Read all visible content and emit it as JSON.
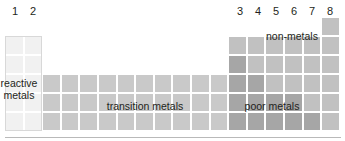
{
  "figure": {
    "kind": "periodic-table-schematic",
    "background": "#ffffff",
    "baseline_color": "#b9b9b9"
  },
  "column_labels": [
    {
      "text": "1",
      "x": 8
    },
    {
      "text": "2",
      "x": 26
    },
    {
      "text": "3",
      "x": 233
    },
    {
      "text": "4",
      "x": 251
    },
    {
      "text": "5",
      "x": 269
    },
    {
      "text": "6",
      "x": 287
    },
    {
      "text": "7",
      "x": 305
    },
    {
      "text": "8",
      "x": 323
    }
  ],
  "regions": [
    {
      "id": "reactive-metals",
      "label": "reactive\nmetals",
      "color": "#f1f1f1",
      "columns": "1-2"
    },
    {
      "id": "transition-metals",
      "label": "transition metals",
      "color": "#c9c9c9",
      "columns": "3-12"
    },
    {
      "id": "non-metals",
      "label": "non-metals",
      "color": "#c1c1c1",
      "columns": "13-18"
    },
    {
      "id": "poor-metals",
      "label": "poor metals",
      "color": "#a6a6a6",
      "columns": "13-16"
    }
  ],
  "grid": {
    "cell_width": 18.6,
    "row_heights": [
      19,
      19,
      19,
      19,
      19
    ],
    "cells": [
      {
        "col": 18,
        "row": 0,
        "type": "c-nonmetal"
      },
      {
        "col": 1,
        "row": 1,
        "type": "c-reactive"
      },
      {
        "col": 2,
        "row": 1,
        "type": "c-reactive"
      },
      {
        "col": 13,
        "row": 1,
        "type": "c-nonmetal"
      },
      {
        "col": 14,
        "row": 1,
        "type": "c-nonmetal"
      },
      {
        "col": 15,
        "row": 1,
        "type": "c-nonmetal"
      },
      {
        "col": 16,
        "row": 1,
        "type": "c-nonmetal"
      },
      {
        "col": 17,
        "row": 1,
        "type": "c-nonmetal"
      },
      {
        "col": 18,
        "row": 1,
        "type": "c-nonmetal"
      },
      {
        "col": 1,
        "row": 2,
        "type": "c-reactive"
      },
      {
        "col": 2,
        "row": 2,
        "type": "c-reactive"
      },
      {
        "col": 13,
        "row": 2,
        "type": "c-poor"
      },
      {
        "col": 14,
        "row": 2,
        "type": "c-nonmetal"
      },
      {
        "col": 15,
        "row": 2,
        "type": "c-nonmetal"
      },
      {
        "col": 16,
        "row": 2,
        "type": "c-nonmetal"
      },
      {
        "col": 17,
        "row": 2,
        "type": "c-nonmetal"
      },
      {
        "col": 18,
        "row": 2,
        "type": "c-nonmetal"
      },
      {
        "col": 1,
        "row": 3,
        "type": "c-reactive"
      },
      {
        "col": 2,
        "row": 3,
        "type": "c-reactive"
      },
      {
        "col": 3,
        "row": 3,
        "type": "c-transition"
      },
      {
        "col": 4,
        "row": 3,
        "type": "c-transition"
      },
      {
        "col": 5,
        "row": 3,
        "type": "c-transition"
      },
      {
        "col": 6,
        "row": 3,
        "type": "c-transition"
      },
      {
        "col": 7,
        "row": 3,
        "type": "c-transition"
      },
      {
        "col": 8,
        "row": 3,
        "type": "c-transition"
      },
      {
        "col": 9,
        "row": 3,
        "type": "c-transition"
      },
      {
        "col": 10,
        "row": 3,
        "type": "c-transition"
      },
      {
        "col": 11,
        "row": 3,
        "type": "c-transition"
      },
      {
        "col": 12,
        "row": 3,
        "type": "c-transition"
      },
      {
        "col": 13,
        "row": 3,
        "type": "c-poor"
      },
      {
        "col": 14,
        "row": 3,
        "type": "c-poor"
      },
      {
        "col": 15,
        "row": 3,
        "type": "c-nonmetal"
      },
      {
        "col": 16,
        "row": 3,
        "type": "c-nonmetal"
      },
      {
        "col": 17,
        "row": 3,
        "type": "c-nonmetal"
      },
      {
        "col": 18,
        "row": 3,
        "type": "c-nonmetal"
      },
      {
        "col": 1,
        "row": 4,
        "type": "c-reactive"
      },
      {
        "col": 2,
        "row": 4,
        "type": "c-reactive"
      },
      {
        "col": 3,
        "row": 4,
        "type": "c-transition"
      },
      {
        "col": 4,
        "row": 4,
        "type": "c-transition"
      },
      {
        "col": 5,
        "row": 4,
        "type": "c-transition"
      },
      {
        "col": 6,
        "row": 4,
        "type": "c-transition"
      },
      {
        "col": 7,
        "row": 4,
        "type": "c-transition"
      },
      {
        "col": 8,
        "row": 4,
        "type": "c-transition"
      },
      {
        "col": 9,
        "row": 4,
        "type": "c-transition"
      },
      {
        "col": 10,
        "row": 4,
        "type": "c-transition"
      },
      {
        "col": 11,
        "row": 4,
        "type": "c-transition"
      },
      {
        "col": 12,
        "row": 4,
        "type": "c-transition"
      },
      {
        "col": 13,
        "row": 4,
        "type": "c-poor"
      },
      {
        "col": 14,
        "row": 4,
        "type": "c-poor"
      },
      {
        "col": 15,
        "row": 4,
        "type": "c-poor"
      },
      {
        "col": 16,
        "row": 4,
        "type": "c-poor"
      },
      {
        "col": 17,
        "row": 4,
        "type": "c-nonmetal"
      },
      {
        "col": 18,
        "row": 4,
        "type": "c-nonmetal"
      },
      {
        "col": 1,
        "row": 5,
        "type": "c-reactive"
      },
      {
        "col": 2,
        "row": 5,
        "type": "c-reactive"
      },
      {
        "col": 3,
        "row": 5,
        "type": "c-transition"
      },
      {
        "col": 4,
        "row": 5,
        "type": "c-transition"
      },
      {
        "col": 5,
        "row": 5,
        "type": "c-transition"
      },
      {
        "col": 6,
        "row": 5,
        "type": "c-transition"
      },
      {
        "col": 7,
        "row": 5,
        "type": "c-transition"
      },
      {
        "col": 8,
        "row": 5,
        "type": "c-transition"
      },
      {
        "col": 9,
        "row": 5,
        "type": "c-transition"
      },
      {
        "col": 10,
        "row": 5,
        "type": "c-transition"
      },
      {
        "col": 11,
        "row": 5,
        "type": "c-transition"
      },
      {
        "col": 12,
        "row": 5,
        "type": "c-transition"
      },
      {
        "col": 13,
        "row": 5,
        "type": "c-poor"
      },
      {
        "col": 14,
        "row": 5,
        "type": "c-poor"
      },
      {
        "col": 15,
        "row": 5,
        "type": "c-poor"
      },
      {
        "col": 16,
        "row": 5,
        "type": "c-poor"
      },
      {
        "col": 17,
        "row": 5,
        "type": "c-poor"
      },
      {
        "col": 18,
        "row": 5,
        "type": "c-nonmetal"
      }
    ]
  }
}
